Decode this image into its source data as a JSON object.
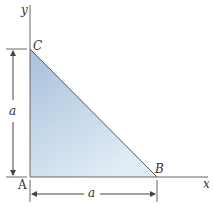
{
  "diagram": {
    "labels": {
      "y_axis": "y",
      "x_axis": "x",
      "point_c": "C",
      "point_a": "A",
      "point_b": "B",
      "vertical_dim": "a",
      "horizontal_dim": "a"
    },
    "colors": {
      "fill_top": "#a9c3dc",
      "fill_bottom": "#dce9f4",
      "stroke": "#555555"
    }
  }
}
